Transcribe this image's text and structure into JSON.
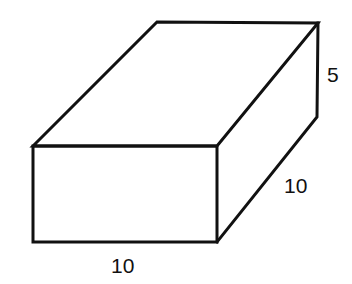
{
  "diagram": {
    "type": "rectangular-prism",
    "dimensions": {
      "length": "10",
      "width": "10",
      "height": "5"
    },
    "labels": {
      "front_bottom": "10",
      "right_depth": "10",
      "height": "5"
    },
    "stroke_color": "#111111",
    "background_color": "#ffffff"
  }
}
